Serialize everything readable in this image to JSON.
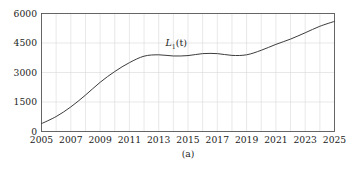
{
  "figure": {
    "caption": "(a)",
    "curve_label_base": "L",
    "curve_label_sub": "1",
    "curve_label_arg": "(t)"
  },
  "chart_data": {
    "type": "line",
    "title": "",
    "subtitle": "",
    "xlabel": "",
    "ylabel": "",
    "caption": "(a)",
    "grid": true,
    "legend_position": "inline-annotation",
    "xlim": [
      2005,
      2025
    ],
    "ylim": [
      0,
      6000
    ],
    "xticks": [
      2005,
      2007,
      2009,
      2011,
      2013,
      2015,
      2017,
      2019,
      2021,
      2023,
      2025
    ],
    "xticklabels": [
      "2005",
      "2007",
      "2009",
      "2011",
      "2013",
      "2015",
      "2017",
      "2019",
      "2021",
      "2023",
      "2025"
    ],
    "yticks": [
      0,
      1500,
      3000,
      4500,
      6000
    ],
    "yticklabels": [
      "0",
      "1500",
      "3000",
      "4500",
      "6000"
    ],
    "x_minor_gridlines": [
      2006,
      2008,
      2010,
      2012,
      2014,
      2016,
      2018,
      2020,
      2022,
      2024
    ],
    "line_color": "#3c3c3c",
    "grid_color": "#d9d9d9",
    "frame_color": "#555555",
    "annotations": [
      {
        "text": "L_1(t)",
        "x": 2014.2,
        "y": 4330
      }
    ],
    "series": [
      {
        "name": "L_1(t)",
        "x": [
          2005,
          2006,
          2007,
          2008,
          2009,
          2010,
          2011,
          2012,
          2013,
          2014,
          2015,
          2016,
          2017,
          2018,
          2019,
          2020,
          2021,
          2022,
          2023,
          2024,
          2025
        ],
        "values": [
          400,
          760,
          1250,
          1850,
          2500,
          3050,
          3500,
          3830,
          3900,
          3840,
          3860,
          3960,
          3960,
          3870,
          3900,
          4130,
          4430,
          4700,
          5020,
          5350,
          5600
        ]
      }
    ]
  }
}
